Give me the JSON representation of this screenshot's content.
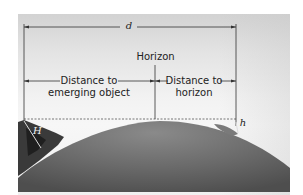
{
  "diagram": {
    "title_label": "d",
    "horizon_label": "Horizon",
    "left_segment": {
      "line1": "Distance to",
      "line2": "emerging object"
    },
    "right_segment": {
      "line1": "Distance to",
      "line2": "horizon"
    },
    "height_object": "H",
    "height_observer": "h",
    "colors": {
      "sky_top": "#d2d2d2",
      "sky_bottom": "#f5f5f5",
      "sea": "#6e6e6e",
      "land": "#3a3a3a",
      "lines": "#333333"
    }
  }
}
